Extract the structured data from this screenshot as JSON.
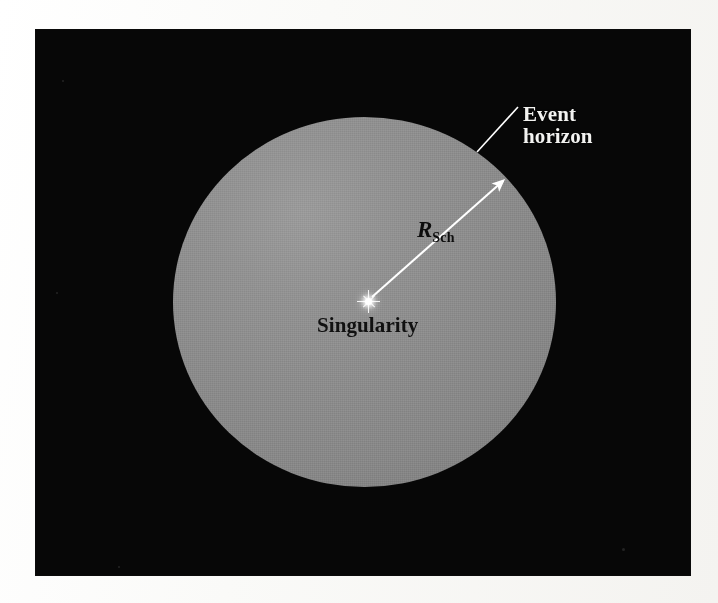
{
  "figure": {
    "domain_note": "astronomy diagram of a Schwarzschild black hole",
    "panel_background_color": "#070707",
    "sphere_color": "#8a8a8a",
    "annotation_line_color": "#ffffff",
    "dark_text_color": "#111111",
    "light_text_color": "#f2f2f0"
  },
  "labels": {
    "event_horizon": {
      "line1": "Event",
      "line2": "horizon",
      "color": "#f2f2f0"
    },
    "singularity": {
      "text": "Singularity",
      "color": "#111111"
    },
    "radius": {
      "symbol": "R",
      "subscript": "Sch",
      "color": "#0d0d0d"
    }
  },
  "graphics": {
    "sphere": {
      "name": "event-horizon-sphere",
      "center_x": 365,
      "center_y": 302,
      "radius_x": 191,
      "radius_y": 185
    },
    "radius_arrow": {
      "name": "radius-arrow",
      "from_x": 370,
      "from_y": 298,
      "to_x": 506,
      "to_y": 177
    },
    "leader_line": {
      "name": "event-horizon-leader-line",
      "from_x": 477,
      "from_y": 152,
      "to_x": 517,
      "to_y": 108
    },
    "singularity_point": {
      "name": "singularity-star",
      "x": 368,
      "y": 301
    }
  },
  "specks": [
    {
      "x": 62,
      "y": 80,
      "size": 2
    },
    {
      "x": 56,
      "y": 292,
      "size": 2
    },
    {
      "x": 622,
      "y": 548,
      "size": 3
    },
    {
      "x": 118,
      "y": 566,
      "size": 2
    }
  ]
}
